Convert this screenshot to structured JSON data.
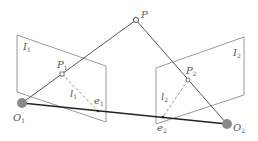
{
  "diagram": {
    "type": "epipolar-geometry",
    "colors": {
      "plane": "#9a9a9a",
      "ray": "#555555",
      "baseline": "#222222",
      "epiline": "#999999",
      "camera": "#8a8a8a"
    },
    "points": {
      "P": {
        "label": "P",
        "x": 136,
        "y": 20
      },
      "P1": {
        "label": "P",
        "sub": "1",
        "x": 62,
        "y": 74
      },
      "P2": {
        "label": "P",
        "sub": "2",
        "x": 188,
        "y": 80
      },
      "O1": {
        "label": "O",
        "sub": "1",
        "x": 22,
        "y": 103
      },
      "O2": {
        "label": "O",
        "sub": "2",
        "x": 227,
        "y": 124
      },
      "e1": {
        "label": "e",
        "sub": "1",
        "x": 98,
        "y": 111
      },
      "e2": {
        "label": "e",
        "sub": "2",
        "x": 163,
        "y": 117
      }
    },
    "planes": {
      "I1": {
        "label": "I",
        "sub": "1"
      },
      "I2": {
        "label": "I",
        "sub": "2"
      }
    },
    "epilines": {
      "l1": {
        "label": "l",
        "sub": "1"
      },
      "l2": {
        "label": "l",
        "sub": "2"
      }
    }
  }
}
